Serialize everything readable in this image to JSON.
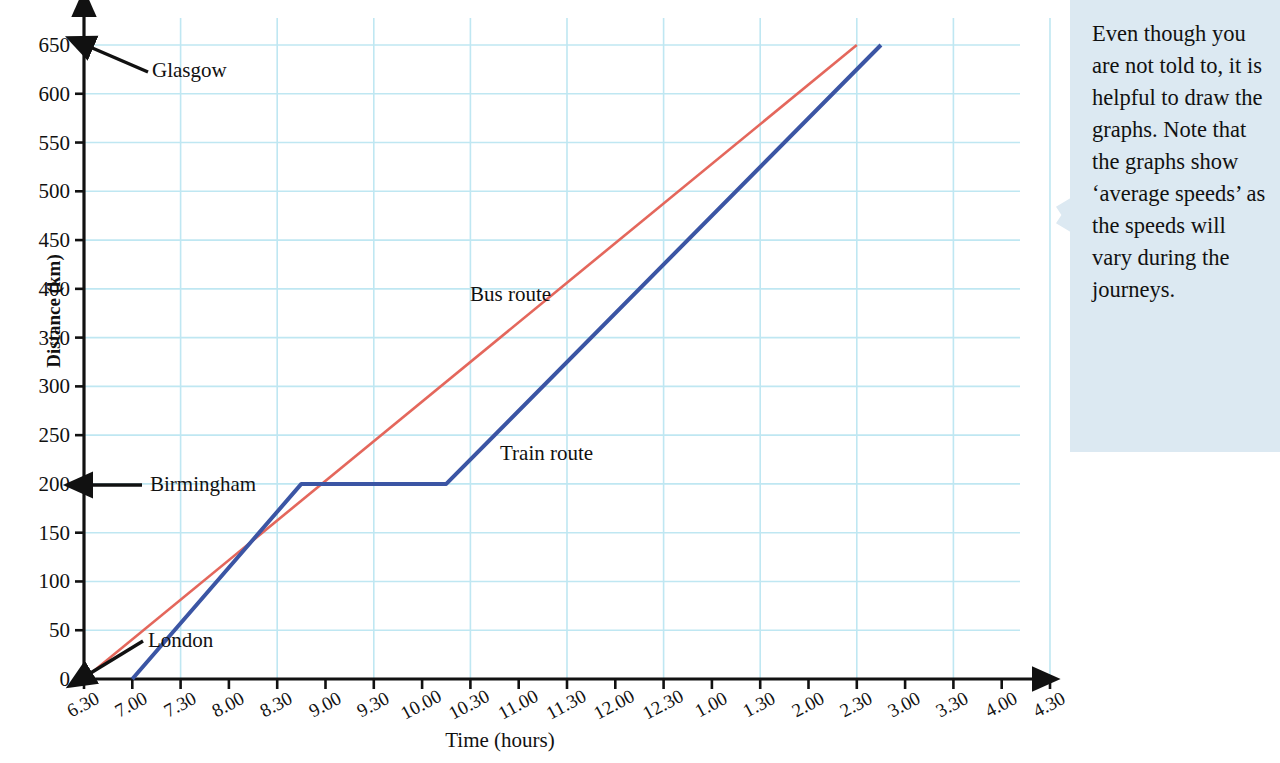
{
  "chart_data": {
    "type": "line",
    "title": "",
    "xlabel": "Time (hours)",
    "ylabel": "Distance (km)",
    "xlim": [
      "6.30",
      "4.30"
    ],
    "ylim": [
      0,
      650
    ],
    "grid": true,
    "legend_position": "inline-labels",
    "y_ticks": [
      0,
      50,
      100,
      150,
      200,
      250,
      300,
      350,
      400,
      450,
      500,
      550,
      600,
      650
    ],
    "x_ticks": [
      "6.30",
      "7.00",
      "7.30",
      "8.00",
      "8.30",
      "9.00",
      "9.30",
      "10.00",
      "10.30",
      "11.00",
      "11.30",
      "12.00",
      "12.30",
      "1.00",
      "1.30",
      "2.00",
      "2.30",
      "3.00",
      "3.30",
      "4.00",
      "4.30"
    ],
    "series": [
      {
        "name": "Bus route",
        "color": "#e4675c",
        "points": [
          {
            "t": "6.30",
            "km": 0
          },
          {
            "t": "2.30",
            "km": 650
          }
        ]
      },
      {
        "name": "Train route",
        "color": "#3b55a4",
        "points": [
          {
            "t": "7.00",
            "km": 0
          },
          {
            "t": "8.45",
            "km": 200
          },
          {
            "t": "10.15",
            "km": 200
          },
          {
            "t": "2.45",
            "km": 650
          }
        ]
      }
    ],
    "annotations": [
      {
        "name": "glasgow",
        "text": "Glasgow",
        "km": 650,
        "arrow": "to-y-axis"
      },
      {
        "name": "birmingham",
        "text": "Birmingham",
        "km": 200,
        "arrow": "to-y-axis"
      },
      {
        "name": "london",
        "text": "London",
        "km": 0,
        "arrow": "to-origin"
      },
      {
        "name": "bus-route",
        "text": "Bus route"
      },
      {
        "name": "train-route",
        "text": "Train route"
      }
    ],
    "grid_color": "#bfe7f2",
    "axis_color": "#111111"
  },
  "axes": {
    "y_title": "Distance (km)",
    "x_title": "Time (hours)",
    "y_ticks": [
      "0",
      "50",
      "100",
      "150",
      "200",
      "250",
      "300",
      "350",
      "400",
      "450",
      "500",
      "550",
      "600",
      "650"
    ],
    "x_ticks": [
      "6.30",
      "7.00",
      "7.30",
      "8.00",
      "8.30",
      "9.00",
      "9.30",
      "10.00",
      "10.30",
      "11.00",
      "11.30",
      "12.00",
      "12.30",
      "1.00",
      "1.30",
      "2.00",
      "2.30",
      "3.00",
      "3.30",
      "4.00",
      "4.30"
    ]
  },
  "labels": {
    "glasgow": "Glasgow",
    "birmingham": "Birmingham",
    "london": "London",
    "bus_route": "Bus route",
    "train_route": "Train route"
  },
  "callout": {
    "text": "Even though you are not told to, it is helpful to draw the graphs. Note that the graphs show ‘average speeds’ as the speeds will vary during the journeys.",
    "background": "#dce9f2"
  }
}
